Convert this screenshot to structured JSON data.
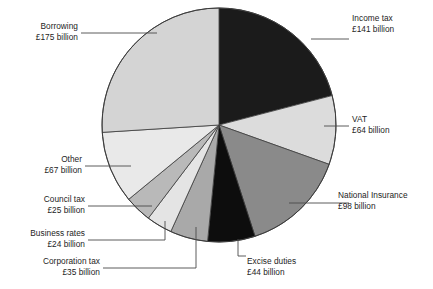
{
  "figure": {
    "kind": "pie-chart",
    "background_color": "#ffffff",
    "currency_symbol": "£",
    "unit": "billion"
  },
  "chart_data": {
    "type": "pie",
    "title": "",
    "subtitle": "",
    "xlabel": "",
    "ylabel": "",
    "legend_position": "none",
    "grid": false,
    "units": "£ billion",
    "total": 673,
    "start_angle_deg": 0,
    "direction": "clockwise",
    "categories": [
      "Income tax",
      "VAT",
      "National Insurance",
      "Excise duties",
      "Corporation tax",
      "Business rates",
      "Council tax",
      "Other",
      "Borrowing"
    ],
    "values": [
      141,
      64,
      98,
      44,
      35,
      24,
      25,
      67,
      175
    ],
    "colors": [
      "#1b1b1b",
      "#dcdcdc",
      "#8a8a8a",
      "#0d0d0d",
      "#a9a9a9",
      "#e4e4e4",
      "#b9b9b9",
      "#e9e9e9",
      "#d4d4d4"
    ],
    "slice_labels": [
      "£141 billion",
      "£64 billion",
      "£98 billion",
      "£44 billion",
      "£35 billion",
      "£24 billion",
      "£25 billion",
      "£67 billion",
      "£175 billion"
    ]
  },
  "labels": [
    {
      "name": "income-tax",
      "title": "Income tax",
      "value": "£141 billion"
    },
    {
      "name": "vat",
      "title": "VAT",
      "value": "£64 billion"
    },
    {
      "name": "national-insurance",
      "title": "National Insurance",
      "value": "£98 billion"
    },
    {
      "name": "excise-duties",
      "title": "Excise duties",
      "value": "£44 billion"
    },
    {
      "name": "corporation-tax",
      "title": "Corporation tax",
      "value": "£35 billion"
    },
    {
      "name": "business-rates",
      "title": "Business rates",
      "value": "£24 billion"
    },
    {
      "name": "council-tax",
      "title": "Council tax",
      "value": "£25 billion"
    },
    {
      "name": "other",
      "title": "Other",
      "value": "£67 billion"
    },
    {
      "name": "borrowing",
      "title": "Borrowing",
      "value": "£175 billion"
    }
  ]
}
